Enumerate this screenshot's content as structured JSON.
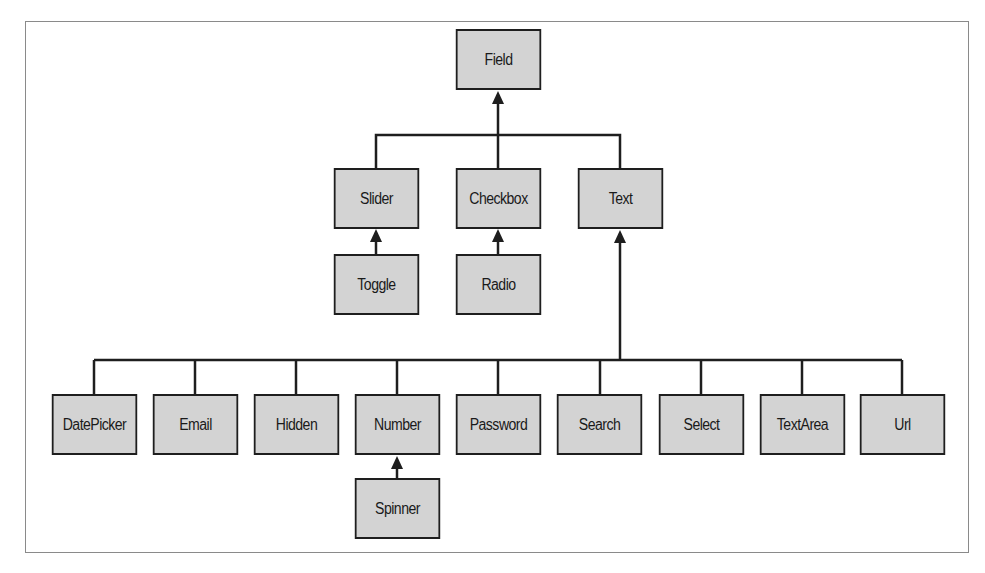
{
  "diagram": {
    "type": "class-hierarchy",
    "colors": {
      "node_fill": "#d3d3d3",
      "node_border": "#1e1e1e",
      "line": "#1e1e1e",
      "frame": "#8a8a8a"
    },
    "nodes": {
      "field": "Field",
      "slider": "Slider",
      "checkbox": "Checkbox",
      "text": "Text",
      "toggle": "Toggle",
      "radio": "Radio",
      "datepicker": "DatePicker",
      "email": "Email",
      "hidden": "Hidden",
      "number": "Number",
      "password": "Password",
      "search": "Search",
      "select": "Select",
      "textarea": "TextArea",
      "url": "Url",
      "spinner": "Spinner"
    },
    "edges": [
      {
        "child": "Slider",
        "parent": "Field"
      },
      {
        "child": "Checkbox",
        "parent": "Field"
      },
      {
        "child": "Text",
        "parent": "Field"
      },
      {
        "child": "Toggle",
        "parent": "Slider"
      },
      {
        "child": "Radio",
        "parent": "Checkbox"
      },
      {
        "child": "DatePicker",
        "parent": "Text"
      },
      {
        "child": "Email",
        "parent": "Text"
      },
      {
        "child": "Hidden",
        "parent": "Text"
      },
      {
        "child": "Number",
        "parent": "Text"
      },
      {
        "child": "Password",
        "parent": "Text"
      },
      {
        "child": "Search",
        "parent": "Text"
      },
      {
        "child": "Select",
        "parent": "Text"
      },
      {
        "child": "TextArea",
        "parent": "Text"
      },
      {
        "child": "Url",
        "parent": "Text"
      },
      {
        "child": "Spinner",
        "parent": "Number"
      }
    ]
  }
}
